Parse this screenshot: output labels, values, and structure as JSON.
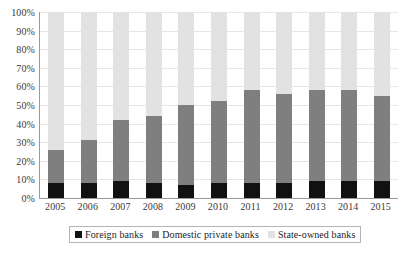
{
  "chart_data": {
    "type": "bar",
    "title": "",
    "subtitle": "",
    "xlabel": "",
    "ylabel": "",
    "stacked": true,
    "stack_total": 100,
    "grid": true,
    "legend_position": "bottom",
    "ylim": [
      0,
      100
    ],
    "y_ticks": [
      0,
      10,
      20,
      30,
      40,
      50,
      60,
      70,
      80,
      90,
      100
    ],
    "y_tick_labels": [
      "0%",
      "10%",
      "20%",
      "30%",
      "40%",
      "50%",
      "60%",
      "70%",
      "80%",
      "90%",
      "100%"
    ],
    "categories": [
      "2005",
      "2006",
      "2007",
      "2008",
      "2009",
      "2010",
      "2011",
      "2012",
      "2013",
      "2014",
      "2015"
    ],
    "series": [
      {
        "name": "Foreign banks",
        "color": "#111111",
        "values": [
          8,
          8,
          9,
          8,
          7,
          8,
          8,
          8,
          9,
          9,
          9
        ]
      },
      {
        "name": "Domestic private banks",
        "color": "#7f7f7f",
        "values": [
          18,
          23,
          33,
          36,
          43,
          44,
          50,
          48,
          49,
          49,
          46
        ]
      },
      {
        "name": "State-owned banks",
        "color": "#e2e2e2",
        "values": [
          74,
          69,
          58,
          56,
          50,
          48,
          42,
          44,
          42,
          42,
          45
        ]
      }
    ],
    "cumulative_tops": {
      "foreign_plus_domestic": [
        26,
        31,
        42,
        44,
        50,
        52,
        58,
        56,
        58,
        58,
        55
      ]
    }
  },
  "legend": {
    "items": [
      {
        "label": "Foreign banks",
        "color": "#111111"
      },
      {
        "label": "Domestic private banks",
        "color": "#7f7f7f"
      },
      {
        "label": "State-owned banks",
        "color": "#e2e2e2"
      }
    ]
  }
}
